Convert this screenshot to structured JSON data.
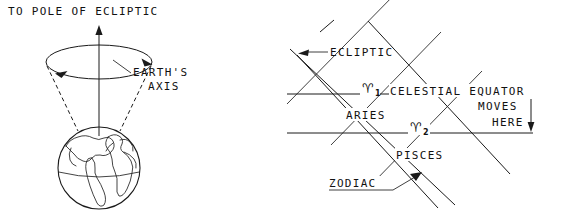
{
  "figure": {
    "background_color": "#ffffff",
    "ink_color": "#111111"
  },
  "left_panel": {
    "name": "earth-precession-cone",
    "labels": {
      "top_title": "TO POLE OF ECLIPTIC",
      "axis_line1": "EARTH'S",
      "axis_line2": "AXIS"
    },
    "elements": {
      "precession_circle": "ellipse showing path traced by earth's axis",
      "axis_arrow": "vertical arrow pointing up to pole of ecliptic",
      "cone_sides": "dashed lines forming precession cone",
      "globe": "earth sphere with continents and equator",
      "rotation_arrows": "two arrowheads on ellipse showing precession direction"
    }
  },
  "right_panel": {
    "name": "zodiac-equinox-shift",
    "labels": {
      "ecliptic": "ECLIPTIC",
      "celestial_equator": "CELESTIAL EQUATOR",
      "moves_line1": "MOVES",
      "moves_line2": "HERE",
      "aries": "ARIES",
      "pisces": "PISCES",
      "zodiac": "ZODIAC"
    },
    "symbols": [
      {
        "glyph": "♈",
        "subscript": "1",
        "name": "aries-symbol-first-point"
      },
      {
        "glyph": "♈",
        "subscript": "2",
        "name": "aries-symbol-second-point"
      }
    ],
    "elements": {
      "equator_upper": "upper horizontal celestial equator line",
      "equator_lower": "lower horizontal celestial equator line",
      "zodiac_band": "diagonal band of the zodiac crossing the equator",
      "constellation_dividers": "perpendicular lines separating Aries and Pisces",
      "moves_arrow": "downward arrow between the two equator positions",
      "ecliptic_leader": "leader line with arrowhead pointing to ecliptic line",
      "zodiac_leader": "leader line with arrowhead pointing into zodiac band"
    }
  }
}
